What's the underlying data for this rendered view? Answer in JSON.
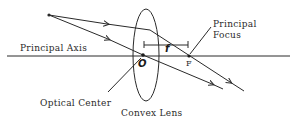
{
  "diagram": {
    "labels": {
      "principal_axis": "Principal Axis",
      "principal_focus_line1": "Principal",
      "principal_focus_line2": "Focus",
      "optical_center": "Optical Center",
      "lens": "Convex Lens",
      "center_symbol": "O",
      "focus_symbol": "F",
      "focal_length_symbol": "f"
    },
    "colors": {
      "stroke": "#2a2a2a",
      "background": "#ffffff"
    }
  }
}
